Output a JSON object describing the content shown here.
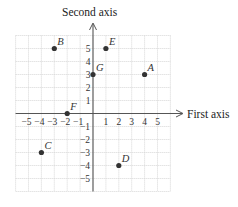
{
  "diagram": {
    "type": "coordinate-plane",
    "x_axis_label": "First axis",
    "y_axis_label": "Second axis",
    "x_ticks": [
      -5,
      -4,
      -3,
      -2,
      -1,
      1,
      2,
      3,
      4,
      5
    ],
    "y_ticks": [
      5,
      4,
      3,
      2,
      1,
      -1,
      -2,
      -3,
      -4,
      -5
    ],
    "grid_range": {
      "xmin": -6,
      "xmax": 6,
      "ymin": -6,
      "ymax": 6
    },
    "points": [
      {
        "label": "A",
        "x": 4,
        "y": 3
      },
      {
        "label": "B",
        "x": -3,
        "y": 5
      },
      {
        "label": "C",
        "x": -4,
        "y": -3
      },
      {
        "label": "D",
        "x": 2,
        "y": -4
      },
      {
        "label": "E",
        "x": 1,
        "y": 5
      },
      {
        "label": "F",
        "x": -2,
        "y": 0
      },
      {
        "label": "G",
        "x": 0,
        "y": 3
      }
    ],
    "colors": {
      "grid": "#d4d4d4",
      "axis": "#555555",
      "point": "#333333",
      "text": "#222222"
    }
  }
}
